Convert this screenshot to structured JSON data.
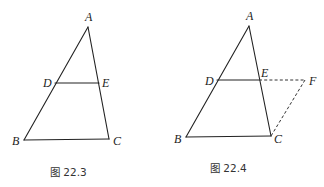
{
  "figures": [
    {
      "id": "fig-22-3",
      "caption": "图 22.3",
      "points": {
        "A": {
          "label": "A",
          "x": 88,
          "y": 27,
          "lx": 88,
          "ly": 20
        },
        "B": {
          "label": "B",
          "x": 24,
          "y": 140,
          "lx": 15,
          "ly": 145
        },
        "C": {
          "label": "C",
          "x": 109,
          "y": 139,
          "lx": 117,
          "ly": 144
        },
        "D": {
          "label": "D",
          "x": 55,
          "y": 83,
          "lx": 46,
          "ly": 87
        },
        "E": {
          "label": "E",
          "x": 99,
          "y": 83,
          "lx": 106,
          "ly": 87
        }
      },
      "solid_segments": [
        [
          "A",
          "B"
        ],
        [
          "A",
          "C"
        ],
        [
          "B",
          "C"
        ],
        [
          "D",
          "E"
        ]
      ],
      "dashed_segments": []
    },
    {
      "id": "fig-22-4",
      "caption": "图 22.4",
      "points": {
        "A": {
          "label": "A",
          "x": 249,
          "y": 26,
          "lx": 249,
          "ly": 19
        },
        "B": {
          "label": "B",
          "x": 186,
          "y": 137,
          "lx": 177,
          "ly": 143
        },
        "C": {
          "label": "C",
          "x": 271,
          "y": 136,
          "lx": 279,
          "ly": 143
        },
        "D": {
          "label": "D",
          "x": 217,
          "y": 80,
          "lx": 207,
          "ly": 85
        },
        "E": {
          "label": "E",
          "x": 259,
          "y": 80,
          "lx": 264,
          "ly": 76
        },
        "F": {
          "label": "F",
          "x": 305,
          "y": 80,
          "lx": 313,
          "ly": 85
        }
      },
      "solid_segments": [
        [
          "A",
          "B"
        ],
        [
          "A",
          "C"
        ],
        [
          "B",
          "C"
        ],
        [
          "D",
          "E"
        ]
      ],
      "dashed_segments": [
        [
          "E",
          "F"
        ],
        [
          "F",
          "C"
        ]
      ]
    }
  ],
  "captions": {
    "left": "图 22.3",
    "right": "图 22.4"
  },
  "labels": {
    "f1": {
      "A": "A",
      "B": "B",
      "C": "C",
      "D": "D",
      "E": "E"
    },
    "f2": {
      "A": "A",
      "B": "B",
      "C": "C",
      "D": "D",
      "E": "E",
      "F": "F"
    }
  },
  "colors": {
    "line": "#222222",
    "background": "#ffffff",
    "text": "#222222"
  }
}
